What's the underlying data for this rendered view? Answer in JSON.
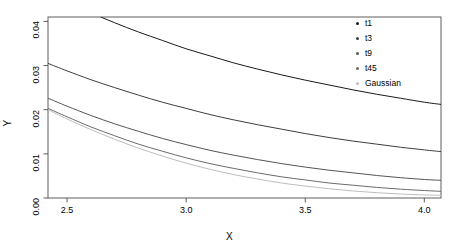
{
  "chart_data": {
    "type": "line",
    "title": "",
    "xlabel": "X",
    "ylabel": "Y",
    "xlim": [
      2.42,
      4.07
    ],
    "ylim": [
      0.0,
      0.041
    ],
    "xticks": [
      "2.5",
      "3.0",
      "3.5",
      "4.0"
    ],
    "xtick_values": [
      2.5,
      3.0,
      3.5,
      4.0
    ],
    "yticks": [
      "0.00",
      "0.01",
      "0.02",
      "0.03",
      "0.04"
    ],
    "ytick_values": [
      0.0,
      0.01,
      0.02,
      0.03,
      0.04
    ],
    "grid": false,
    "legend_position": "top-right",
    "x": [
      2.42,
      2.5,
      2.6,
      2.7,
      2.8,
      2.9,
      3.0,
      3.1,
      3.2,
      3.3,
      3.4,
      3.5,
      3.6,
      3.7,
      3.8,
      3.9,
      4.0,
      4.07
    ],
    "series": [
      {
        "name": "t1",
        "color": "#1a1a1a",
        "values": [
          0.048,
          0.0448,
          0.042,
          0.0397,
          0.0376,
          0.0357,
          0.0338,
          0.0322,
          0.0306,
          0.0292,
          0.0279,
          0.0267,
          0.0256,
          0.0245,
          0.0235,
          0.0226,
          0.0217,
          0.0212
        ]
      },
      {
        "name": "t3",
        "color": "#3d3d3d",
        "values": [
          0.0305,
          0.0288,
          0.0268,
          0.025,
          0.0233,
          0.0217,
          0.0203,
          0.0189,
          0.0177,
          0.0166,
          0.0156,
          0.0146,
          0.0137,
          0.0129,
          0.0122,
          0.0115,
          0.0109,
          0.0105
        ]
      },
      {
        "name": "t9",
        "color": "#555555",
        "values": [
          0.0226,
          0.0208,
          0.0187,
          0.0168,
          0.0151,
          0.0135,
          0.0121,
          0.0108,
          0.0097,
          0.0087,
          0.0078,
          0.007,
          0.0063,
          0.0057,
          0.0051,
          0.0046,
          0.0042,
          0.004
        ]
      },
      {
        "name": "t45",
        "color": "#6b6b6b",
        "values": [
          0.0203,
          0.0184,
          0.0161,
          0.0141,
          0.0122,
          0.0106,
          0.0091,
          0.0078,
          0.0067,
          0.0057,
          0.0048,
          0.0041,
          0.0034,
          0.0029,
          0.0024,
          0.002,
          0.0017,
          0.0015
        ]
      },
      {
        "name": "Gaussian",
        "color": "#bdbdbd",
        "values": [
          0.02,
          0.0179,
          0.0155,
          0.0133,
          0.0113,
          0.0095,
          0.0079,
          0.0065,
          0.0053,
          0.0043,
          0.0034,
          0.0027,
          0.0021,
          0.0016,
          0.0012,
          0.0009,
          0.0007,
          0.0006
        ]
      }
    ]
  },
  "axes": {
    "x_title": "X",
    "y_title": "Y"
  },
  "legend": {
    "items": [
      {
        "label": "t1",
        "color": "#1a1a1a"
      },
      {
        "label": "t3",
        "color": "#3d3d3d"
      },
      {
        "label": "t9",
        "color": "#555555"
      },
      {
        "label": "t45",
        "color": "#6b6b6b"
      },
      {
        "label": "Gaussian",
        "color": "#bdbdbd"
      }
    ]
  },
  "style": {
    "axis_color": "#4d4d4d",
    "background": "#ffffff"
  }
}
